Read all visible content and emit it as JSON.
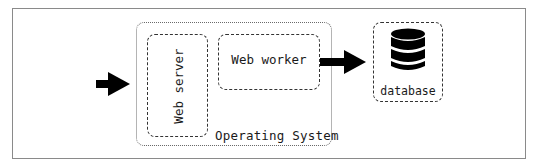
{
  "diagram": {
    "os_label": "Operating System",
    "web_server_label": "Web server",
    "web_worker_label": "Web worker",
    "database_label": "database",
    "icons": {
      "input_arrow": "arrow-right-icon",
      "output_arrow": "arrow-right-icon",
      "database": "database-icon"
    },
    "colors": {
      "stroke": "#333333",
      "fill": "#000000",
      "frame": "#8a8a8a",
      "background": "#ffffff"
    }
  }
}
